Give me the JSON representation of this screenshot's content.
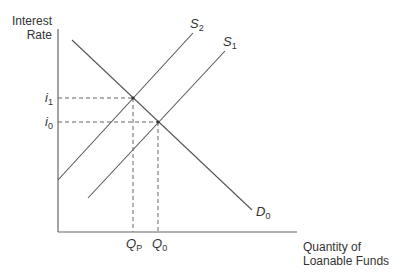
{
  "diagram": {
    "y_axis_label_line1": "Interest",
    "y_axis_label_line2": "Rate",
    "x_axis_label_line1": "Quantity of",
    "x_axis_label_line2": "Loanable Funds",
    "curves": [
      {
        "name": "S",
        "sub": "2",
        "type": "supply"
      },
      {
        "name": "S",
        "sub": "1",
        "type": "supply"
      },
      {
        "name": "D",
        "sub": "0",
        "type": "demand"
      }
    ],
    "y_ticks": [
      {
        "name": "i",
        "sub": "1"
      },
      {
        "name": "i",
        "sub": "0"
      }
    ],
    "x_ticks": [
      {
        "name": "Q",
        "sub": "P"
      },
      {
        "name": "Q",
        "sub": "0"
      }
    ],
    "line_color": "#555555"
  }
}
